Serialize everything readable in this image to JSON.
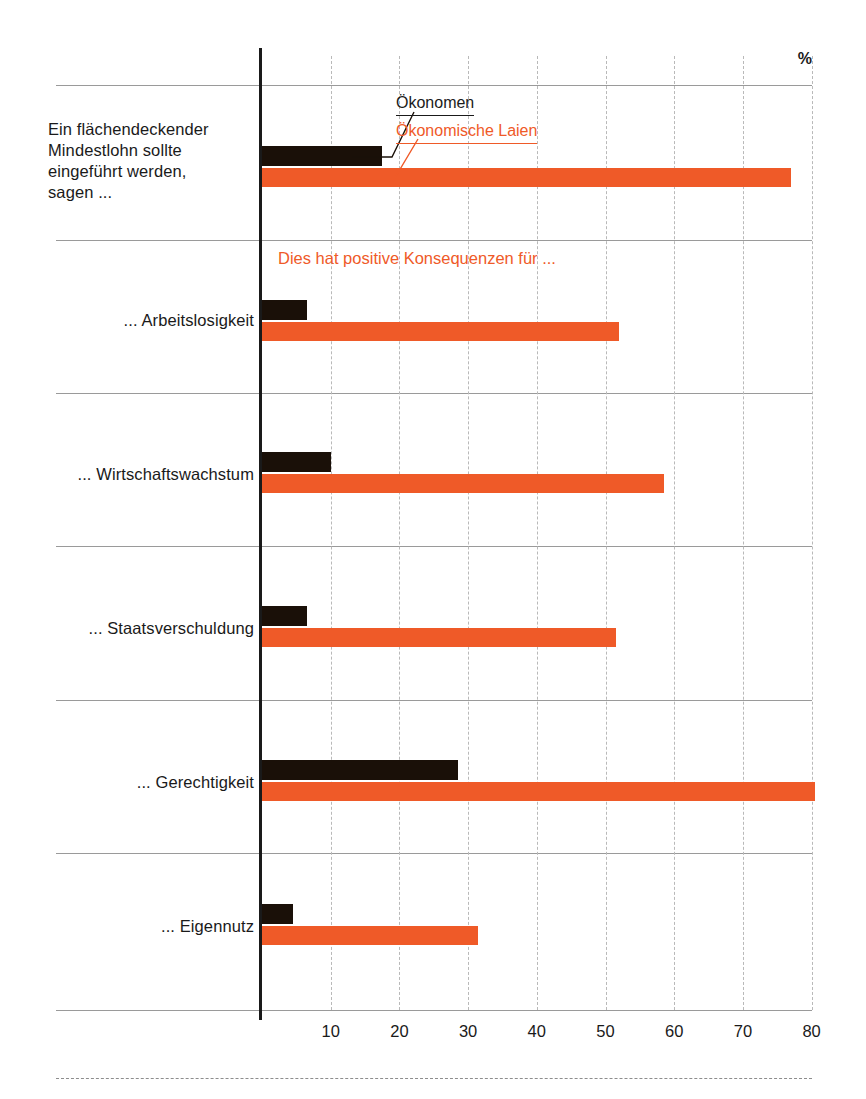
{
  "chart_data": {
    "type": "bar",
    "orientation": "horizontal",
    "title": "",
    "subtitle": "Dies hat positive Konsequenzen für ...",
    "unit_label": "%",
    "xlabel": "",
    "ylabel": "",
    "xlim": [
      0,
      85
    ],
    "xticks": [
      10,
      20,
      30,
      40,
      50,
      60,
      70,
      80
    ],
    "grid": "vertical-dashed",
    "legend_position": "top-inside",
    "categories": [
      "Ein flächendeckender Mindestlohn sollte eingeführt werden, sagen ...",
      "... Arbeitslosigkeit",
      "... Wirtschaftswachstum",
      "... Staatsverschuldung",
      "... Gerechtigkeit",
      "... Eigennutz"
    ],
    "series": [
      {
        "name": "Ökonomen",
        "color": "#1a1008",
        "values": [
          17.5,
          6.5,
          10,
          6.5,
          28.5,
          4.5
        ]
      },
      {
        "name": "Ökonomische Laien",
        "color": "#ef5a28",
        "values": [
          77,
          52,
          58.5,
          51.5,
          80.5,
          31.5
        ]
      }
    ]
  },
  "legend": {
    "economists": "Ökonomen",
    "laypeople": "Ökonomische Laien"
  },
  "axis": {
    "percent_symbol": "%",
    "ticks": [
      "10",
      "20",
      "30",
      "40",
      "50",
      "60",
      "70",
      "80"
    ]
  },
  "labels": {
    "question_line1": "Ein flächendeckender",
    "question_line2": "Mindestlohn sollte",
    "question_line3": "eingeführt werden,",
    "question_line4": "sagen ...",
    "subheading": "Dies hat positive Konsequenzen für ...",
    "cat_arbeitslosigkeit": "... Arbeitslosigkeit",
    "cat_wirtschaftswachstum": "... Wirtschaftswachstum",
    "cat_staatsverschuldung": "... Staatsverschuldung",
    "cat_gerechtigkeit": "... Gerechtigkeit",
    "cat_eigennutz": "... Eigennutz"
  },
  "colors": {
    "economists": "#1a1008",
    "laypeople": "#ef5a28",
    "rule": "#9a9a9a",
    "grid": "#b9b9b9"
  }
}
